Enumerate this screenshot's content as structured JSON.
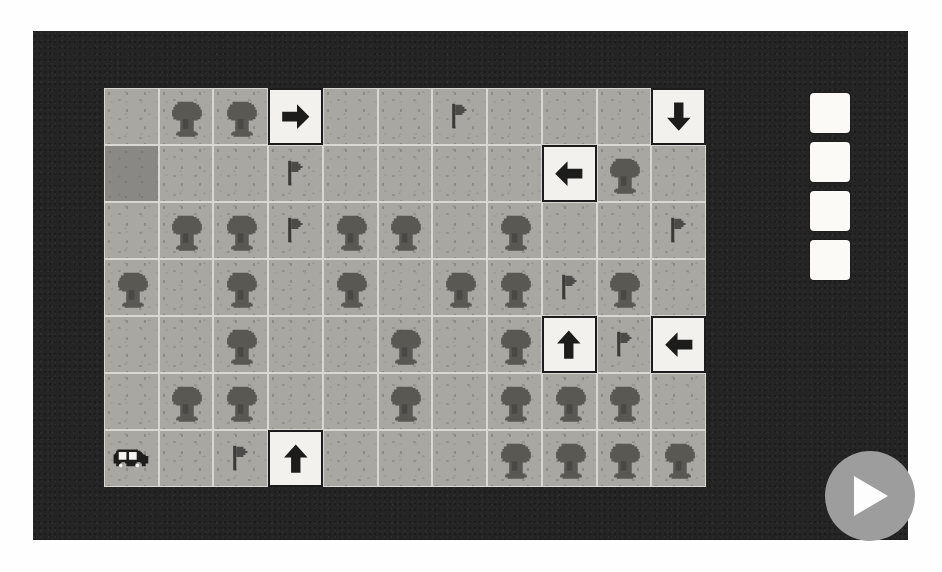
{
  "app": {
    "title": "Grid Route Puzzle",
    "frame_color": "#242424",
    "board_tile_color": "#a9a7a1",
    "arrow_tile_color": "#f2f1ee",
    "slot_color": "#fbfaf7",
    "play_button_color": "#9d9d9d"
  },
  "board": {
    "name": "puzzle-board",
    "columns": 11,
    "rows": 7,
    "legend": {
      "empty": "empty grass tile",
      "dark": "dark grass tile",
      "tree": "tree-icon",
      "flag": "flag-icon",
      "car": "car-icon",
      "arrow-right": "arrow-right-icon",
      "arrow-left": "arrow-left-icon",
      "arrow-up": "arrow-up-icon",
      "arrow-down": "arrow-down-icon"
    },
    "cells": [
      [
        "empty",
        "tree",
        "tree",
        "arrow-right",
        "empty",
        "empty",
        "flag",
        "empty",
        "empty",
        "empty",
        "arrow-down"
      ],
      [
        "dark",
        "empty",
        "empty",
        "flag",
        "empty",
        "empty",
        "empty",
        "empty",
        "arrow-left",
        "tree",
        "empty"
      ],
      [
        "empty",
        "tree",
        "tree",
        "flag",
        "tree",
        "tree",
        "empty",
        "tree",
        "empty",
        "empty",
        "flag"
      ],
      [
        "tree",
        "empty",
        "tree",
        "empty",
        "tree",
        "empty",
        "tree",
        "tree",
        "flag",
        "tree",
        "empty"
      ],
      [
        "empty",
        "empty",
        "tree",
        "empty",
        "empty",
        "tree",
        "empty",
        "tree",
        "arrow-up",
        "flag",
        "arrow-left"
      ],
      [
        "empty",
        "tree",
        "tree",
        "empty",
        "empty",
        "tree",
        "empty",
        "tree",
        "tree",
        "tree",
        "empty"
      ],
      [
        "car",
        "empty",
        "flag",
        "arrow-up",
        "empty",
        "empty",
        "empty",
        "tree",
        "tree",
        "tree",
        "tree"
      ]
    ]
  },
  "slot_tray": {
    "name": "command-slot-tray",
    "slots": [
      {
        "label": "",
        "filled": false
      },
      {
        "label": "",
        "filled": false
      },
      {
        "label": "",
        "filled": false
      },
      {
        "label": "",
        "filled": false
      }
    ]
  },
  "controls": {
    "play_label": "",
    "play_icon": "play-icon"
  }
}
